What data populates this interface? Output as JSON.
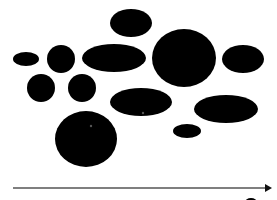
{
  "diagram": {
    "background": "#ffffff",
    "fill_color": "#000000",
    "shapes": [
      {
        "id": "top-ellipse",
        "cx": 131,
        "cy": 23,
        "rx": 21,
        "ry": 14
      },
      {
        "id": "small-left-ellipse",
        "cx": 26,
        "cy": 59,
        "rx": 13,
        "ry": 7
      },
      {
        "id": "left-circle-upper",
        "cx": 61,
        "cy": 59,
        "rx": 14,
        "ry": 14
      },
      {
        "id": "wide-ellipse",
        "cx": 114,
        "cy": 58,
        "rx": 32,
        "ry": 14
      },
      {
        "id": "large-circle",
        "cx": 184,
        "cy": 58,
        "rx": 32,
        "ry": 29
      },
      {
        "id": "right-ellipse",
        "cx": 243,
        "cy": 59,
        "rx": 21,
        "ry": 14
      },
      {
        "id": "left-circle-lower-a",
        "cx": 41,
        "cy": 88,
        "rx": 14,
        "ry": 14
      },
      {
        "id": "left-circle-lower-b",
        "cx": 82,
        "cy": 88,
        "rx": 14,
        "ry": 14
      },
      {
        "id": "middle-ellipse",
        "cx": 141,
        "cy": 102,
        "rx": 31,
        "ry": 14
      },
      {
        "id": "right-middle-ellipse",
        "cx": 226,
        "cy": 109,
        "rx": 32,
        "ry": 14
      },
      {
        "id": "small-right-ellipse",
        "cx": 187,
        "cy": 131,
        "rx": 14,
        "ry": 7
      },
      {
        "id": "bottom-large-circle",
        "cx": 86,
        "cy": 139,
        "rx": 31,
        "ry": 28
      },
      {
        "id": "cutoff-bottom-shape",
        "cx": 251,
        "cy": 202,
        "rx": 6,
        "ry": 4
      }
    ],
    "specks": [
      {
        "cx": 143,
        "cy": 113,
        "r": 1.2,
        "color": "#555555"
      },
      {
        "cx": 91,
        "cy": 126,
        "r": 1.2,
        "color": "#555555"
      }
    ],
    "axis_arrow": {
      "x1": 13,
      "y1": 188,
      "x2": 266,
      "y2": 188,
      "color": "#555555",
      "head_color": "#111111",
      "direction": "right"
    }
  }
}
